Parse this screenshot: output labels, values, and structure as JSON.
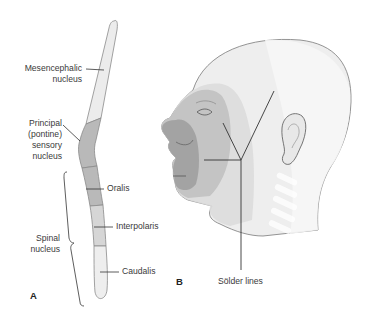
{
  "panels": {
    "a_label": "A",
    "b_label": "B"
  },
  "panel_a": {
    "labels": {
      "mesencephalic_1": "Mesencephalic",
      "mesencephalic_2": "nucleus",
      "principal_1": "Principal",
      "principal_2": "(pontine)",
      "principal_3": "sensory",
      "principal_4": "nucleus",
      "spinal_1": "Spinal",
      "spinal_2": "nucleus",
      "oralis": "Oralis",
      "interpolaris": "Interpolaris",
      "caudalis": "Caudalis"
    },
    "colors": {
      "mesencephalic": "#ececec",
      "principal": "#b9b9b9",
      "oralis": "#b9b9b9",
      "interpolaris": "#d6d6d6",
      "caudalis": "#eeeeee",
      "outline": "#8a8a8a"
    }
  },
  "panel_b": {
    "labels": {
      "solder_lines": "Sölder lines"
    },
    "colors": {
      "zone_inner": "#9e9e9e",
      "zone_middle": "#c2c2c2",
      "zone_outer": "#dcdcdc",
      "head_base": "#eeeeee",
      "outline": "#7a7a7a"
    }
  }
}
